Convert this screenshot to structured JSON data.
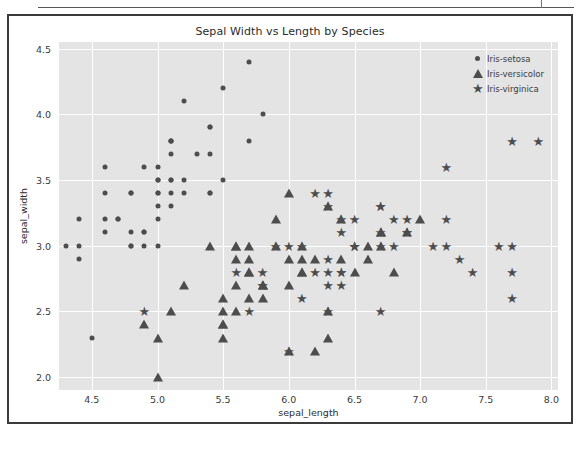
{
  "chart_data": {
    "type": "scatter",
    "title": "Sepal Width vs Length by Species",
    "xlabel": "sepal_length",
    "ylabel": "sepal_width",
    "xlim": [
      4.25,
      8.05
    ],
    "ylim": [
      1.9,
      4.55
    ],
    "xticks": [
      "4.5",
      "5.0",
      "5.5",
      "6.0",
      "6.5",
      "7.0",
      "7.5",
      "8.0"
    ],
    "xtick_values": [
      4.5,
      5.0,
      5.5,
      6.0,
      6.5,
      7.0,
      7.5,
      8.0
    ],
    "yticks": [
      "2.0",
      "2.5",
      "3.0",
      "3.5",
      "4.0",
      "4.5"
    ],
    "ytick_values": [
      2.0,
      2.5,
      3.0,
      3.5,
      4.0,
      4.5
    ],
    "grid": true,
    "grid_color": "#ffffff",
    "plot_bgcolor": "#e4e4e4",
    "marker_color": "#4d4d4d",
    "legend_position": "upper right",
    "series": [
      {
        "name": "Iris-setosa",
        "marker": "circle",
        "points": [
          [
            5.1,
            3.5
          ],
          [
            4.9,
            3.0
          ],
          [
            4.7,
            3.2
          ],
          [
            4.6,
            3.1
          ],
          [
            5.0,
            3.6
          ],
          [
            5.4,
            3.9
          ],
          [
            4.6,
            3.4
          ],
          [
            5.0,
            3.4
          ],
          [
            4.4,
            2.9
          ],
          [
            4.9,
            3.1
          ],
          [
            5.4,
            3.7
          ],
          [
            4.8,
            3.4
          ],
          [
            4.8,
            3.0
          ],
          [
            4.3,
            3.0
          ],
          [
            5.8,
            4.0
          ],
          [
            5.7,
            4.4
          ],
          [
            5.4,
            3.9
          ],
          [
            5.1,
            3.5
          ],
          [
            5.7,
            3.8
          ],
          [
            5.1,
            3.8
          ],
          [
            5.4,
            3.4
          ],
          [
            5.1,
            3.7
          ],
          [
            4.6,
            3.6
          ],
          [
            5.1,
            3.3
          ],
          [
            4.8,
            3.4
          ],
          [
            5.0,
            3.0
          ],
          [
            5.0,
            3.4
          ],
          [
            5.2,
            3.5
          ],
          [
            5.2,
            3.4
          ],
          [
            4.7,
            3.2
          ],
          [
            4.8,
            3.1
          ],
          [
            5.4,
            3.4
          ],
          [
            5.2,
            4.1
          ],
          [
            5.5,
            4.2
          ],
          [
            4.9,
            3.1
          ],
          [
            5.0,
            3.2
          ],
          [
            5.5,
            3.5
          ],
          [
            4.9,
            3.6
          ],
          [
            4.4,
            3.0
          ],
          [
            5.1,
            3.4
          ],
          [
            5.0,
            3.5
          ],
          [
            4.5,
            2.3
          ],
          [
            4.4,
            3.2
          ],
          [
            5.0,
            3.5
          ],
          [
            5.1,
            3.8
          ],
          [
            4.8,
            3.0
          ],
          [
            5.1,
            3.8
          ],
          [
            4.6,
            3.2
          ],
          [
            5.3,
            3.7
          ],
          [
            5.0,
            3.3
          ]
        ]
      },
      {
        "name": "Iris-versicolor",
        "marker": "triangle",
        "points": [
          [
            7.0,
            3.2
          ],
          [
            6.4,
            3.2
          ],
          [
            6.9,
            3.1
          ],
          [
            5.5,
            2.3
          ],
          [
            6.5,
            2.8
          ],
          [
            5.7,
            2.8
          ],
          [
            6.3,
            3.3
          ],
          [
            4.9,
            2.4
          ],
          [
            6.6,
            2.9
          ],
          [
            5.2,
            2.7
          ],
          [
            5.0,
            2.0
          ],
          [
            5.9,
            3.0
          ],
          [
            6.0,
            2.2
          ],
          [
            6.1,
            2.9
          ],
          [
            5.6,
            2.9
          ],
          [
            6.7,
            3.1
          ],
          [
            5.6,
            3.0
          ],
          [
            5.8,
            2.7
          ],
          [
            6.2,
            2.2
          ],
          [
            5.6,
            2.5
          ],
          [
            5.9,
            3.2
          ],
          [
            6.1,
            2.8
          ],
          [
            6.3,
            2.5
          ],
          [
            6.1,
            2.8
          ],
          [
            6.4,
            2.9
          ],
          [
            6.6,
            3.0
          ],
          [
            6.8,
            2.8
          ],
          [
            6.7,
            3.0
          ],
          [
            6.0,
            2.9
          ],
          [
            5.7,
            2.6
          ],
          [
            5.5,
            2.4
          ],
          [
            5.5,
            2.4
          ],
          [
            5.8,
            2.7
          ],
          [
            6.0,
            2.7
          ],
          [
            5.4,
            3.0
          ],
          [
            6.0,
            3.4
          ],
          [
            6.7,
            3.1
          ],
          [
            6.3,
            2.3
          ],
          [
            5.6,
            3.0
          ],
          [
            5.5,
            2.5
          ],
          [
            5.5,
            2.6
          ],
          [
            6.1,
            3.0
          ],
          [
            5.8,
            2.6
          ],
          [
            5.0,
            2.3
          ],
          [
            5.6,
            2.7
          ],
          [
            5.7,
            3.0
          ],
          [
            5.7,
            2.9
          ],
          [
            6.2,
            2.9
          ],
          [
            5.1,
            2.5
          ],
          [
            5.7,
            2.8
          ]
        ]
      },
      {
        "name": "Iris-virginica",
        "marker": "star",
        "points": [
          [
            6.3,
            3.3
          ],
          [
            5.8,
            2.7
          ],
          [
            7.1,
            3.0
          ],
          [
            6.3,
            2.9
          ],
          [
            6.5,
            3.0
          ],
          [
            7.6,
            3.0
          ],
          [
            4.9,
            2.5
          ],
          [
            7.3,
            2.9
          ],
          [
            6.7,
            2.5
          ],
          [
            7.2,
            3.6
          ],
          [
            6.5,
            3.2
          ],
          [
            6.4,
            2.7
          ],
          [
            6.8,
            3.0
          ],
          [
            5.7,
            2.5
          ],
          [
            5.8,
            2.8
          ],
          [
            6.4,
            3.2
          ],
          [
            6.5,
            3.0
          ],
          [
            7.7,
            3.8
          ],
          [
            7.7,
            2.6
          ],
          [
            6.0,
            2.2
          ],
          [
            6.9,
            3.2
          ],
          [
            5.6,
            2.8
          ],
          [
            7.7,
            2.8
          ],
          [
            6.3,
            2.7
          ],
          [
            6.7,
            3.3
          ],
          [
            7.2,
            3.2
          ],
          [
            6.2,
            2.8
          ],
          [
            6.1,
            3.0
          ],
          [
            6.4,
            2.8
          ],
          [
            7.2,
            3.0
          ],
          [
            7.4,
            2.8
          ],
          [
            7.9,
            3.8
          ],
          [
            6.4,
            2.8
          ],
          [
            6.3,
            2.8
          ],
          [
            6.1,
            2.6
          ],
          [
            7.7,
            3.0
          ],
          [
            6.3,
            3.4
          ],
          [
            6.4,
            3.1
          ],
          [
            6.0,
            3.0
          ],
          [
            6.9,
            3.1
          ],
          [
            6.7,
            3.1
          ],
          [
            6.9,
            3.1
          ],
          [
            5.8,
            2.7
          ],
          [
            6.8,
            3.2
          ],
          [
            6.7,
            3.3
          ],
          [
            6.7,
            3.0
          ],
          [
            6.3,
            2.5
          ],
          [
            6.5,
            3.0
          ],
          [
            6.2,
            3.4
          ],
          [
            5.9,
            3.0
          ]
        ]
      }
    ]
  },
  "legend": {
    "entries": [
      {
        "label": "Iris-setosa",
        "marker": "circle"
      },
      {
        "label": "Iris-versicolor",
        "marker": "triangle"
      },
      {
        "label": "Iris-virginica",
        "marker": "star"
      }
    ]
  }
}
